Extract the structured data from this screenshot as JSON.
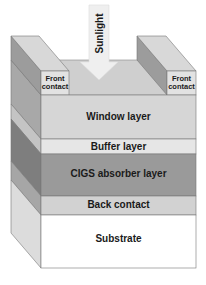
{
  "diagram": {
    "sunlight_label": "Sunlight",
    "front_contacts": [
      {
        "label_line1": "Front",
        "label_line2": "contact"
      },
      {
        "label_line1": "Front",
        "label_line2": "contact"
      }
    ],
    "layers": [
      {
        "label": "Window layer",
        "color": "#d6d6d6"
      },
      {
        "label": "Buffer layer",
        "color": "#e6e6e6"
      },
      {
        "label": "CIGS absorber layer",
        "color": "#9a9a9a"
      },
      {
        "label": "Back contact",
        "color": "#d2d2d2"
      },
      {
        "label": "Substrate",
        "color": "#ffffff"
      }
    ]
  }
}
